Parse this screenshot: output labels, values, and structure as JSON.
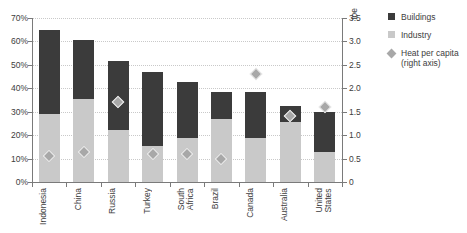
{
  "chart_data": {
    "type": "bar",
    "title": "",
    "subtitle": "",
    "xlabel": "",
    "ylabel": "",
    "y2label": "toe",
    "grid": true,
    "legend_position": "right",
    "stacked": true,
    "categories": [
      "Indonesia",
      "China",
      "Russia",
      "Turkey",
      "South\nAfrica",
      "Brazil",
      "Canada",
      "Australia",
      "United\nStates"
    ],
    "ylim": [
      0,
      70
    ],
    "yticks": [
      "0%",
      "10%",
      "20%",
      "30%",
      "40%",
      "50%",
      "60%",
      "70%"
    ],
    "ytick_values": [
      0,
      10,
      20,
      30,
      40,
      50,
      60,
      70
    ],
    "y2lim": [
      0,
      3.5
    ],
    "y2ticks": [
      "0",
      "0.5",
      "1.0",
      "1.5",
      "2.0",
      "2.5",
      "3.0",
      "3.5"
    ],
    "y2tick_values": [
      0,
      0.5,
      1.0,
      1.5,
      2.0,
      2.5,
      3.0,
      3.5
    ],
    "series": [
      {
        "name": "Industry",
        "type": "bar",
        "axis": "left",
        "color": "#c9c9c9",
        "values": [
          29,
          35.5,
          22,
          15.5,
          19,
          27,
          19,
          25.5,
          13
        ]
      },
      {
        "name": "Buildings",
        "type": "bar",
        "axis": "left",
        "color": "#3b3b3b",
        "values": [
          36,
          25,
          29.5,
          31.5,
          23.5,
          11.5,
          19.5,
          7,
          17
        ]
      },
      {
        "name": "Heat per capita (right axis)",
        "type": "scatter",
        "axis": "right",
        "color": "#a8a8a8",
        "values": [
          0.55,
          0.65,
          1.7,
          0.6,
          0.6,
          0.5,
          2.3,
          1.4,
          1.6
        ]
      }
    ],
    "totals": [
      65,
      60.5,
      51.5,
      47,
      42.5,
      38.5,
      38.5,
      32.5,
      30
    ]
  },
  "legend": {
    "items": [
      {
        "label": "Buildings",
        "swatch": "dark-square"
      },
      {
        "label": "Industry",
        "swatch": "light-square"
      },
      {
        "label": "Heat per capita\n(right axis)",
        "swatch": "gray-diamond"
      }
    ]
  },
  "colors": {
    "buildings": "#3b3b3b",
    "industry": "#c9c9c9",
    "marker": "#a8a8a8",
    "axis": "#7a7a7a",
    "grid": "#c9c9c9",
    "text": "#3d3d3d"
  }
}
